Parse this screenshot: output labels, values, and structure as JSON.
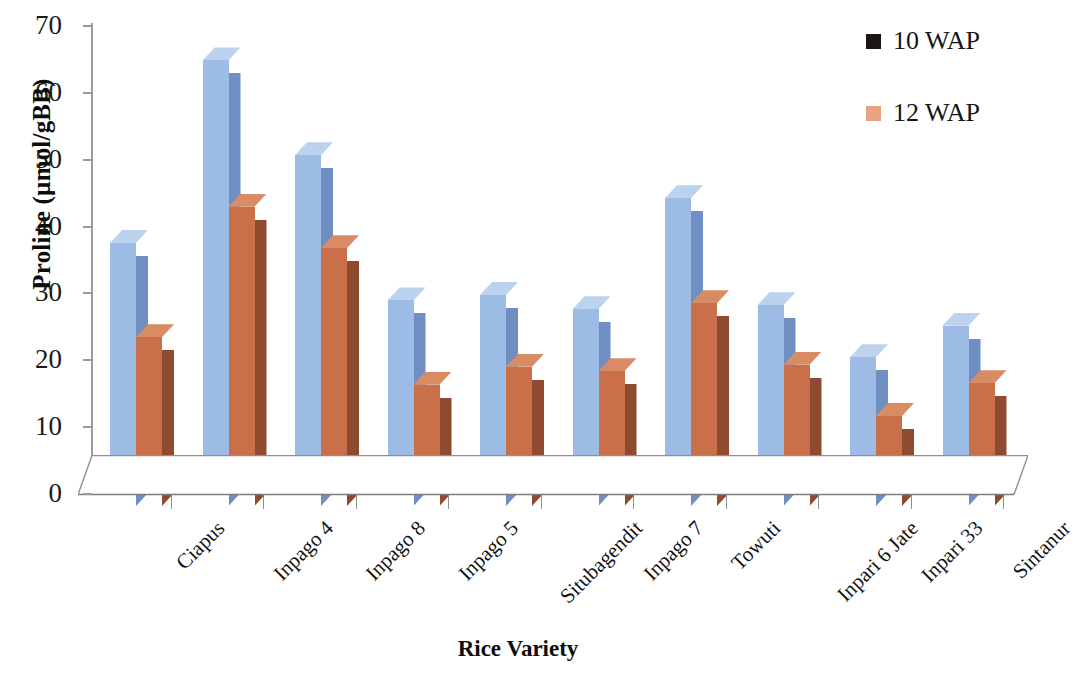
{
  "chart_data": {
    "type": "bar",
    "title": "",
    "xlabel": "Rice Variety",
    "ylabel": "Proline (µmol/gBB)",
    "ylim": [
      0,
      70
    ],
    "yticks": [
      0,
      10,
      20,
      30,
      40,
      50,
      60,
      70
    ],
    "ytick_labels": [
      "0",
      "10",
      "20",
      "30",
      "40",
      "50",
      "60",
      "70"
    ],
    "grid": false,
    "legend_position": "top-right",
    "three_d": true,
    "categories": [
      "Ciapus",
      "Inpago 4",
      "Inpago 8",
      "Inpago 5",
      "Situbagendit",
      "Inpago 7",
      "Towuti",
      "Inpari 6 Jate",
      "Inpari 33",
      "Sintanur"
    ],
    "series": [
      {
        "name": "10 WAP",
        "color": "#9DBCE5",
        "side_color": "#6F8FC2",
        "top_color": "#BCD2EE",
        "legend_swatch": "#1c1613",
        "values": [
          37.4,
          64.7,
          50.5,
          28.8,
          29.6,
          27.5,
          44.1,
          28.1,
          20.3,
          25.0
        ]
      },
      {
        "name": "12 WAP",
        "color": "#C9704A",
        "side_color": "#8E4B30",
        "top_color": "#D98B63",
        "legend_swatch": "#E8A183",
        "values": [
          23.3,
          42.8,
          36.6,
          16.2,
          18.9,
          18.2,
          28.4,
          19.2,
          11.5,
          16.4
        ]
      }
    ]
  },
  "axes": {
    "axis_color": "#9a9a9a",
    "text_color": "#141414"
  }
}
